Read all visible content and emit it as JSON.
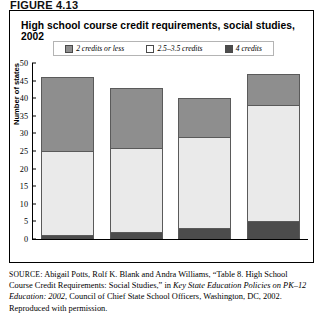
{
  "figure": {
    "label": "FIGURE 4.13",
    "title": "High school course credit requirements, social studies, 2002"
  },
  "legend": {
    "items": [
      {
        "label": "2 credits or less",
        "swatch": "light-gray-hatch",
        "color": "#8e8e8e"
      },
      {
        "label": "2.5–3.5 credits",
        "swatch": "white",
        "color": "#ffffff"
      },
      {
        "label": "4 credits",
        "swatch": "dark-gray",
        "color": "#4c4c4c"
      }
    ]
  },
  "chart_data": {
    "type": "bar",
    "subtype": "stacked",
    "title": "High school course credit requirements, social studies, 2002",
    "xlabel": "",
    "ylabel": "Number of states",
    "ylim": [
      0,
      50
    ],
    "yticks": [
      0,
      5,
      10,
      15,
      20,
      25,
      30,
      35,
      40,
      45,
      50
    ],
    "grid": false,
    "legend_position": "top",
    "categories": [
      "",
      "",
      "",
      ""
    ],
    "series": [
      {
        "name": "4 credits",
        "color": "#4c4c4c",
        "values": [
          1,
          2,
          3,
          5
        ]
      },
      {
        "name": "2.5–3.5 credits",
        "color": "#eaeaea",
        "values": [
          24,
          24,
          26,
          33
        ]
      },
      {
        "name": "2 credits or less",
        "color": "#8e8e8e",
        "values": [
          21,
          17,
          11,
          9
        ]
      }
    ],
    "totals": [
      46,
      43,
      40,
      47
    ]
  },
  "source": {
    "prefix": "SOURCE",
    "line1": ": Abigail Potts, Rolf K. Blank and Andra Williams, “Table 8.",
    "line2": "High School Course Credit Requirements: Social Studies,” in ",
    "italic1": "Key State",
    "italic2": "Education Policies on PK–12 Education: 2002",
    "line3": ", Council of Chief State",
    "line4": "School Officers, Washington, DC, 2002. Reproduced with permission."
  }
}
